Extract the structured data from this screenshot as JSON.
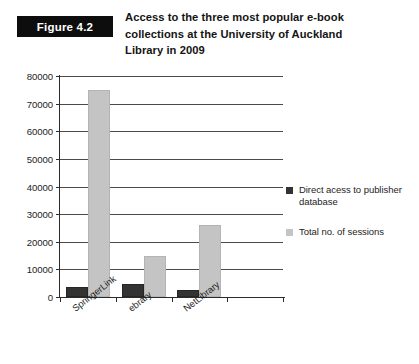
{
  "figure": {
    "label": "Figure 4.2",
    "title_lines": [
      "Access to the three most popular e-book",
      "collections at the University of Auckland",
      "Library in 2009"
    ],
    "title_full": "Access to the three most popular e-book collections at the University of Auckland Library in 2009"
  },
  "colors": {
    "series_dark": "#333333",
    "series_light": "#c4c4c4",
    "axis": "#2b2b2b",
    "gridline": "#4a4a4a",
    "label_box_bg": "#0d0d0d",
    "label_box_text": "#ffffff",
    "background": "#ffffff"
  },
  "chart_data": {
    "type": "bar",
    "title": "Access to the three most popular e-book collections at the University of Auckland Library in 2009",
    "xlabel": "",
    "ylabel": "",
    "categories": [
      "SpringerLink",
      "ebrary",
      "NetLibrary"
    ],
    "series": [
      {
        "name": "Direct acess to publisher database",
        "color": "#333333",
        "values": [
          3500,
          4600,
          2700
        ]
      },
      {
        "name": "Total no. of sessions",
        "color": "#c4c4c4",
        "values": [
          75000,
          14800,
          26000
        ]
      }
    ],
    "ylim": [
      0,
      80000
    ],
    "ytick_values": [
      0,
      10000,
      20000,
      30000,
      40000,
      50000,
      60000,
      70000,
      80000
    ],
    "ytick_labels": [
      "0",
      "10000",
      "20000",
      "30000",
      "40000",
      "50000",
      "60000",
      "70000",
      "80000"
    ],
    "grid": true,
    "grid_axis": "y",
    "legend_position": "right",
    "category_label_rotation": -38,
    "empty_trailing_slot": true
  }
}
